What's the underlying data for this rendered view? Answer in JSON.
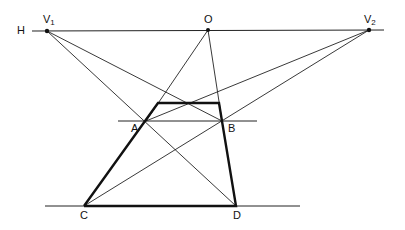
{
  "diagram": {
    "title": "",
    "type": "two-point perspective construction",
    "labels": {
      "H": "H",
      "V1_main": "V",
      "V1_sub": "1",
      "O": "O",
      "V2_main": "V",
      "V2_sub": "2",
      "A": "A",
      "B": "B",
      "C": "C",
      "D": "D"
    },
    "points": {
      "V1": [
        47,
        31
      ],
      "O": [
        208,
        30
      ],
      "V2": [
        369,
        30
      ],
      "A": [
        146,
        121
      ],
      "B": [
        222,
        121
      ],
      "C": [
        84,
        206
      ],
      "D": [
        236,
        206
      ],
      "TL": [
        158,
        103
      ],
      "TR": [
        219,
        103
      ]
    },
    "colors": {
      "line": "#222222",
      "thick": "#111111",
      "background": "#ffffff"
    }
  }
}
